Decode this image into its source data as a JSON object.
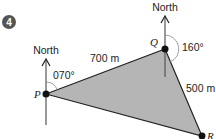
{
  "question_number": "4",
  "points": {
    "P": "P",
    "Q": "Q",
    "R": "R"
  },
  "north_labels": {
    "at_P": "North",
    "at_Q": "North"
  },
  "bearings": {
    "P_to_Q": "070°",
    "Q_to_R": "160°"
  },
  "distances": {
    "PQ": "700 m",
    "QR": "500 m"
  },
  "colors": {
    "triangle_fill": "#b5b5b5",
    "badge": "#555555",
    "line": "#222222"
  }
}
